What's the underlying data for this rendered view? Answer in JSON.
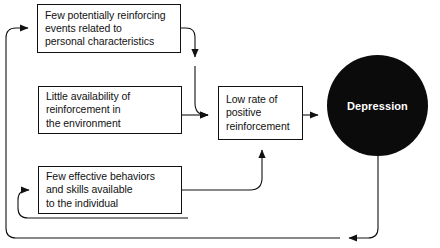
{
  "diagram": {
    "background_color": "#ffffff",
    "line_color": "#111111",
    "nodes": {
      "box1": {
        "name": "few-reinforcing-events",
        "lines": [
          "Few potentially reinforcing",
          "events related to",
          "personal characteristics"
        ]
      },
      "box2": {
        "name": "little-availability-reinforcement",
        "lines": [
          "Little availability of",
          "reinforcement in",
          "the environment"
        ]
      },
      "box3": {
        "name": "few-effective-behaviors",
        "lines": [
          "Few effective behaviors",
          "and skills available",
          "to the individual"
        ]
      },
      "box4": {
        "name": "low-rate-positive-reinforcement",
        "lines": [
          "Low rate of",
          "positive",
          "reinforcement"
        ]
      },
      "depression": {
        "name": "depression",
        "label": "Depression",
        "fill_color": "#0b0b0b",
        "text_color": "#ffffff"
      }
    },
    "connectors": [
      {
        "name": "box1-to-box4",
        "from": "box1",
        "to": "box4"
      },
      {
        "name": "box2-to-box4",
        "from": "box2",
        "to": "box4"
      },
      {
        "name": "box3-to-box4",
        "from": "box3",
        "to": "box4"
      },
      {
        "name": "box4-to-depression",
        "from": "box4",
        "to": "depression"
      },
      {
        "name": "depression-to-box1-feedback",
        "from": "depression",
        "to": "box1"
      },
      {
        "name": "depression-to-box3-feedback",
        "from": "depression",
        "to": "box3"
      }
    ]
  }
}
